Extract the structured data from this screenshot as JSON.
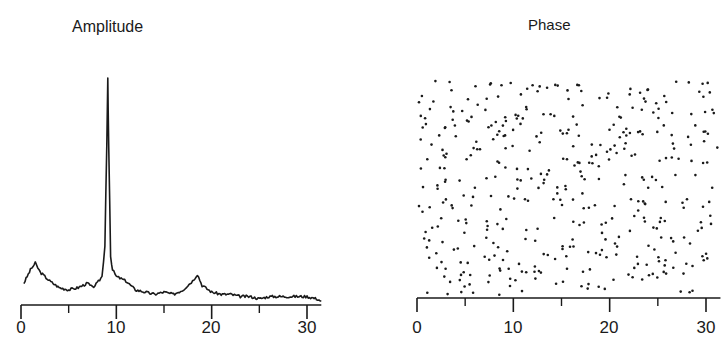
{
  "chart_data": [
    {
      "type": "line",
      "title": "Amplitude",
      "xlabel": "",
      "ylabel": "",
      "xlim": [
        0,
        31.5
      ],
      "x_ticks_major": [
        0,
        10,
        20,
        30
      ],
      "x_ticks_minor": [
        5,
        15,
        25
      ],
      "tick_labels": [
        "0",
        "10",
        "20",
        "30"
      ],
      "grid": false,
      "y_axis_shown": false,
      "description": "Amplitude spectrum with a dominant sharp peak near x≈9, small peaks near x≈1.5 and x≈18.5, low noisy baseline elsewhere",
      "x": [
        0.3,
        1.0,
        1.5,
        2.0,
        3.0,
        4.0,
        5.0,
        6.0,
        7.0,
        7.5,
        8.0,
        8.5,
        8.8,
        9.0,
        9.1,
        9.2,
        9.4,
        9.6,
        10.0,
        11.0,
        12.0,
        13.0,
        14.0,
        15.0,
        16.0,
        17.0,
        18.0,
        18.5,
        19.0,
        20.0,
        21.0,
        22.0,
        23.0,
        24.0,
        25.0,
        26.0,
        27.0,
        28.0,
        29.0,
        30.0,
        31.0,
        31.5
      ],
      "values": [
        0.08,
        0.14,
        0.17,
        0.13,
        0.09,
        0.06,
        0.05,
        0.06,
        0.08,
        0.06,
        0.08,
        0.11,
        0.25,
        0.7,
        1.0,
        0.7,
        0.2,
        0.14,
        0.11,
        0.09,
        0.05,
        0.04,
        0.03,
        0.04,
        0.03,
        0.05,
        0.09,
        0.12,
        0.07,
        0.04,
        0.03,
        0.03,
        0.02,
        0.02,
        0.01,
        0.02,
        0.02,
        0.02,
        0.02,
        0.02,
        0.01,
        0.0
      ]
    },
    {
      "type": "scatter",
      "title": "Phase",
      "xlabel": "",
      "ylabel": "",
      "xlim": [
        0,
        31.5
      ],
      "x_ticks_major": [
        0,
        10,
        20,
        30
      ],
      "x_ticks_minor": [
        5,
        15,
        25
      ],
      "tick_labels": [
        "0",
        "10",
        "20",
        "30"
      ],
      "grid": false,
      "y_axis_shown": false,
      "description": "Phase values appear as uniformly random scattered dots across the full range (~420 points)",
      "point_count_approx": 420,
      "seed": 7
    }
  ],
  "panels": {
    "left": {
      "title": "Amplitude",
      "ticks": [
        "0",
        "10",
        "20",
        "30"
      ]
    },
    "right": {
      "title": "Phase",
      "ticks": [
        "0",
        "10",
        "20",
        "30"
      ]
    }
  }
}
